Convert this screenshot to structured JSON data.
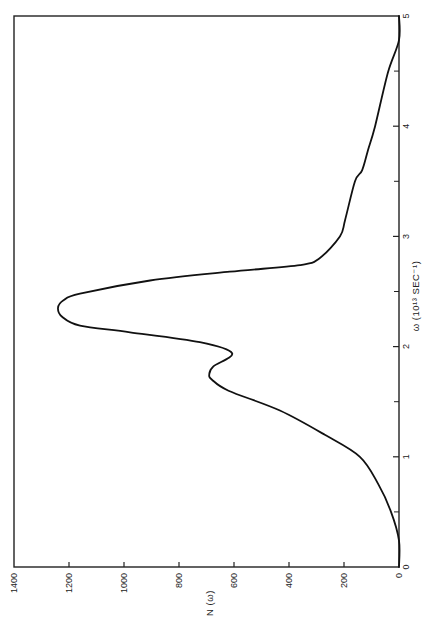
{
  "chart_data": {
    "type": "line",
    "orientation": "rotated-90-ccw",
    "title": "",
    "xlabel": "ω (10¹³ SEC⁻¹)",
    "ylabel": "N (ω)",
    "xlim": [
      0,
      5
    ],
    "ylim": [
      0,
      1400
    ],
    "x_ticks": [
      0,
      1,
      2,
      3,
      4,
      5
    ],
    "x_minor_ticks": [
      0.5,
      1.5,
      2.5,
      3.5,
      4.5
    ],
    "y_ticks": [
      0,
      200,
      400,
      600,
      800,
      1000,
      1200,
      1400
    ],
    "grid": false,
    "legend": null,
    "series": [
      {
        "name": "N(ω)",
        "x": [
          0.0,
          0.24,
          0.5,
          0.75,
          1.0,
          1.2,
          1.42,
          1.6,
          1.7,
          1.75,
          1.82,
          1.94,
          2.04,
          2.13,
          2.19,
          2.27,
          2.35,
          2.42,
          2.48,
          2.6,
          2.68,
          2.74,
          2.8,
          3.0,
          3.15,
          3.5,
          3.6,
          3.78,
          4.0,
          4.49,
          4.78,
          5.0
        ],
        "y": [
          0,
          0,
          29,
          75,
          142,
          270,
          433,
          620,
          680,
          690,
          675,
          607,
          724,
          978,
          1160,
          1225,
          1240,
          1220,
          1160,
          905,
          615,
          360,
          290,
          215,
          196,
          160,
          134,
          113,
          87,
          40,
          0,
          0
        ]
      }
    ]
  },
  "axes": {
    "n_axis_label": "N (ω)",
    "omega_axis_label": "ω (10¹³ SEC⁻¹)",
    "n_tick_labels": [
      "1400",
      "1200",
      "1000",
      "800",
      "600",
      "400",
      "200",
      "0"
    ],
    "omega_tick_labels": [
      "0",
      "1",
      "2",
      "3",
      "4",
      "5"
    ],
    "corner_zero": "0"
  }
}
